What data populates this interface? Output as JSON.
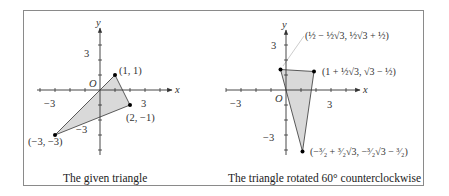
{
  "figure": {
    "left_panel": {
      "caption": "The given triangle",
      "x_axis_label": "x",
      "y_axis_label": "y",
      "origin_label": "O",
      "tick_labels": {
        "x_neg": "−3",
        "x_pos": "3",
        "y_pos": "3",
        "y_neg": "−3"
      },
      "points": [
        {
          "label": "(1, 1)",
          "x": 1,
          "y": 1
        },
        {
          "label": "(2, −1)",
          "x": 2,
          "y": -1
        },
        {
          "label": "(−3, −3)",
          "x": -3,
          "y": -3
        }
      ]
    },
    "right_panel": {
      "caption": "The triangle rotated 60° counterclockwise",
      "x_axis_label": "x",
      "y_axis_label": "y",
      "origin_label": "O",
      "tick_labels": {
        "x_neg": "−3",
        "x_pos": "3",
        "y_pos": "3",
        "y_neg": "−3"
      },
      "points": [
        {
          "label": "(½ − ½√3, ½√3 + ½)",
          "x": -0.366,
          "y": 1.366
        },
        {
          "label": "(1 + ½√3, √3 − ½)",
          "x": 1.866,
          "y": 1.232
        },
        {
          "label": "(−³⁄₂ + ³⁄₂√3, −³⁄₂√3 − ³⁄₂)",
          "x": 1.098,
          "y": -4.098
        }
      ]
    }
  },
  "colors": {
    "fill": "#d9d9d9",
    "stroke": "#333333",
    "frame": "#8a8a8a"
  }
}
